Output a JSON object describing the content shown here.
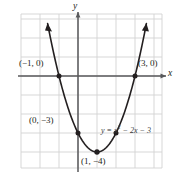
{
  "figure": {
    "kind": "coordinate-plane-parabola",
    "background_color": "#ffffff",
    "grid_color": "#d3d3d3",
    "axis_color": "#58595b",
    "curve_color": "#231f20",
    "label_color": "#231f20",
    "equation_color": "#3a3a3a"
  },
  "axes": {
    "x_label": "x",
    "y_label": "y",
    "x_axis_value": 0,
    "y_axis_value": 0,
    "grid": true,
    "grid_step": 1,
    "xlim": [
      -2.8,
      4.5
    ],
    "ylim": [
      -4.9,
      3.3
    ],
    "unit_px": 19
  },
  "chart_data": {
    "type": "line",
    "title": "",
    "xlabel": "x",
    "ylabel": "y",
    "equation": "y = x² − 2x − 3",
    "equation_parts": {
      "lhs": "y",
      "eq": "=",
      "term1_base": "x",
      "term1_exp": "2",
      "term2": "− 2x",
      "term3": "− 3"
    },
    "xlim": [
      -2.8,
      4.5
    ],
    "ylim": [
      -4.9,
      3.3
    ],
    "grid": true,
    "legend": "none",
    "series": [
      {
        "name": "y = x² − 2x − 3",
        "x": [
          -1.6,
          -1.4,
          -1.2,
          -1.0,
          -0.8,
          -0.6,
          -0.4,
          -0.2,
          0.0,
          0.2,
          0.4,
          0.6,
          0.8,
          1.0,
          1.2,
          1.4,
          1.6,
          1.8,
          2.0,
          2.2,
          2.4,
          2.6,
          2.8,
          3.0,
          3.2,
          3.4,
          3.6
        ],
        "y": [
          2.76,
          1.76,
          0.84,
          0.0,
          -0.76,
          -1.44,
          -2.04,
          -2.56,
          -3.0,
          -3.36,
          -3.64,
          -3.84,
          -3.96,
          -4.0,
          -3.96,
          -3.84,
          -3.64,
          -3.36,
          -3.0,
          -2.56,
          -2.04,
          -1.44,
          -0.76,
          0.0,
          0.84,
          1.76,
          2.76
        ]
      }
    ],
    "marked_points": [
      {
        "x": -1,
        "y": 0,
        "label": "(−1, 0)",
        "labeled": true
      },
      {
        "x": 3,
        "y": 0,
        "label": "(3, 0)",
        "labeled": true
      },
      {
        "x": 0,
        "y": -3,
        "label": "(0, −3)",
        "labeled": true
      },
      {
        "x": 1,
        "y": -4,
        "label": "(1, −4)",
        "labeled": true
      },
      {
        "x": 2,
        "y": -3,
        "label": "",
        "labeled": false
      }
    ],
    "annotations": [
      {
        "name": "root-left-label",
        "text": "(−1, 0)"
      },
      {
        "name": "root-right-label",
        "text": "(3, 0)"
      },
      {
        "name": "y-intercept-label",
        "text": "(0, −3)"
      },
      {
        "name": "vertex-label",
        "text": "(1, −4)"
      },
      {
        "name": "equation-label",
        "text": "y = x² − 2x − 3"
      }
    ]
  },
  "labels": {
    "root_left": "(−1, 0)",
    "root_right": "(3, 0)",
    "y_intercept": "(0, −3)",
    "vertex": "(1, −4)",
    "x_axis": "x",
    "y_axis": "y"
  }
}
